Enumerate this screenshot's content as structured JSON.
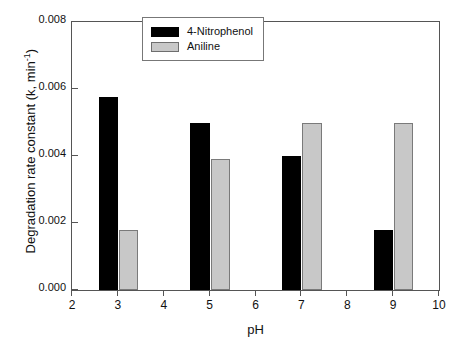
{
  "chart_data": {
    "type": "bar",
    "title": "",
    "xlabel": "pH",
    "ylabel": "Degradation rate constant (k, min",
    "ylabel_sup": "-1",
    "ylabel_tail": ")",
    "categories": [
      3,
      5,
      7,
      9
    ],
    "series": [
      {
        "name": "4-Nitrophenol",
        "color": "#000000",
        "values": [
          0.00575,
          0.005,
          0.004,
          0.0018
        ]
      },
      {
        "name": "Aniline",
        "color": "#c8c8c8",
        "values": [
          0.0018,
          0.0039,
          0.005,
          0.005
        ]
      }
    ],
    "xlim": [
      2,
      10
    ],
    "ylim": [
      0.0,
      0.008
    ],
    "xticks": [
      "2",
      "3",
      "4",
      "5",
      "6",
      "7",
      "8",
      "9",
      "10"
    ],
    "xtick_values": [
      2,
      3,
      4,
      5,
      6,
      7,
      8,
      9,
      10
    ],
    "yticks": [
      "0.000",
      "0.002",
      "0.004",
      "0.006",
      "0.008"
    ],
    "ytick_values": [
      0.0,
      0.002,
      0.004,
      0.006,
      0.008
    ],
    "grid": false,
    "legend_position": "upper center",
    "bar_width_units": 0.42,
    "frame": true
  }
}
